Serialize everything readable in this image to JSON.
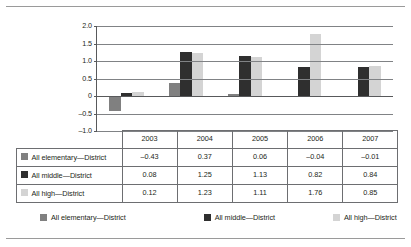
{
  "chart_data": {
    "type": "bar",
    "title": "",
    "xlabel": "",
    "ylabel": "",
    "categories": [
      "2003",
      "2004",
      "2005",
      "2006",
      "2007"
    ],
    "series": [
      {
        "name": "All elementary—District",
        "color": "#808080",
        "values": [
          -0.43,
          0.37,
          0.06,
          -0.04,
          -0.01
        ]
      },
      {
        "name": "All middle—District",
        "color": "#2f2f2f",
        "values": [
          0.08,
          1.25,
          1.13,
          0.82,
          0.84
        ]
      },
      {
        "name": "All high—District",
        "color": "#d4d4d4",
        "values": [
          0.12,
          1.23,
          1.11,
          1.76,
          0.85
        ]
      }
    ],
    "ylim": [
      -1.0,
      2.0
    ],
    "yticks": [
      "2.0",
      "1.5",
      "1.0",
      "0.5",
      "0",
      "-0.5",
      "-1.0"
    ],
    "ytick_values": [
      2.0,
      1.5,
      1.0,
      0.5,
      0,
      -0.5,
      -1.0
    ],
    "grid": true,
    "legend_position": "bottom"
  },
  "table": {
    "corner": "",
    "columns": [
      "2003",
      "2004",
      "2005",
      "2006",
      "2007"
    ],
    "rows": [
      {
        "label": "All elementary—District",
        "color": "#808080",
        "cells": [
          "–0.43",
          "0.37",
          "0.06",
          "–0.04",
          "–0.01"
        ]
      },
      {
        "label": "All middle—District",
        "color": "#2f2f2f",
        "cells": [
          "0.08",
          "1.25",
          "1.13",
          "0.82",
          "0.84"
        ]
      },
      {
        "label": "All high—District",
        "color": "#d4d4d4",
        "cells": [
          "0.12",
          "1.23",
          "1.11",
          "1.76",
          "0.85"
        ]
      }
    ]
  },
  "legend": {
    "items": [
      {
        "label": "All elementary—District",
        "color": "#808080"
      },
      {
        "label": "All middle—District",
        "color": "#2f2f2f"
      },
      {
        "label": "All high—District",
        "color": "#d4d4d4"
      }
    ]
  }
}
